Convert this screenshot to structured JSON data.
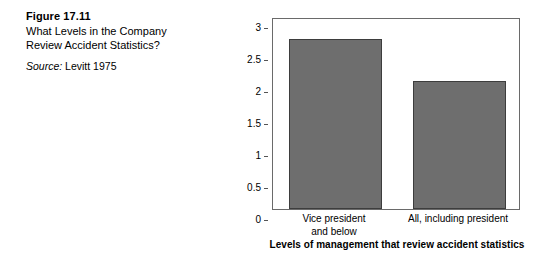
{
  "caption": {
    "figure_number": "Figure 17.11",
    "title_line_1": "What Levels in the Company",
    "title_line_2": "Review Accident Statistics?",
    "source_word": "Source:",
    "source_text": " Levitt 1975"
  },
  "chart_data": {
    "type": "bar",
    "title": "",
    "categories": [
      "Vice president and below",
      "All, including president"
    ],
    "category_lines": [
      [
        "Vice president",
        "and below"
      ],
      [
        "All, including president"
      ]
    ],
    "values": [
      2.65,
      2.0
    ],
    "xlabel": "Levels of management that review accident statistics",
    "ylabel": "Lost-time injury frequency (per 200,000 hours)",
    "ylabel_lines": [
      "Lost-time injury frequency",
      "(per 200,000 hours)"
    ],
    "ylim": [
      0,
      3
    ],
    "yticks": [
      0,
      0.5,
      1,
      1.5,
      2,
      2.5,
      3
    ],
    "ytick_labels": [
      "0",
      "0.5",
      "1",
      "1.5",
      "2",
      "2.5",
      "3"
    ],
    "grid": false,
    "legend": false,
    "bar_color": "#6e6e6e",
    "bar_edge_color": "#3d3d3d",
    "axis_color": "#6a6a6a",
    "background": "#ffffff"
  }
}
